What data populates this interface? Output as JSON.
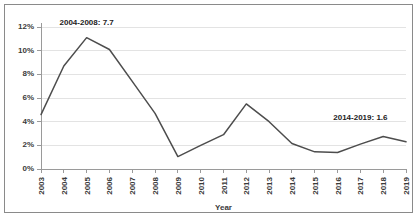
{
  "chart_data": {
    "type": "line",
    "title": "",
    "xlabel": "Year",
    "ylabel": "",
    "categories": [
      "2003",
      "2004",
      "2005",
      "2006",
      "2007",
      "2008",
      "2009",
      "2010",
      "2011",
      "2012",
      "2013",
      "2014",
      "2015",
      "2016",
      "2017",
      "2018",
      "2019"
    ],
    "values": [
      4.6,
      8.7,
      11.1,
      10.1,
      7.4,
      4.7,
      1.05,
      2.0,
      2.9,
      5.5,
      4.0,
      2.15,
      1.45,
      1.4,
      2.1,
      2.75,
      2.3
    ],
    "series": [
      {
        "name": "",
        "values": [
          4.6,
          8.7,
          11.1,
          10.1,
          7.4,
          4.7,
          1.05,
          2.0,
          2.9,
          5.5,
          4.0,
          2.15,
          1.45,
          1.4,
          2.1,
          2.75,
          2.3
        ]
      }
    ],
    "ylim": [
      0,
      12
    ],
    "yticks": [
      0,
      2,
      4,
      6,
      8,
      10,
      12
    ],
    "ytick_labels": [
      "0%",
      "2%",
      "4%",
      "6%",
      "8%",
      "10%",
      "12%"
    ],
    "grid": true,
    "grid_axis": "y",
    "legend": false,
    "legend_position": "none",
    "line_color": "#4d4d4d",
    "grid_color": "#e3e3e3",
    "axis_color": "#9a9a9a",
    "annotations": [
      {
        "text": "2004-2008: 7.7",
        "x_category": "2005",
        "y_value": 12.0,
        "label": "annotation-2004-2008"
      },
      {
        "text": "2014-2019: 1.6",
        "x_category": "2017",
        "y_value": 4.0,
        "label": "annotation-2014-2019"
      }
    ]
  }
}
